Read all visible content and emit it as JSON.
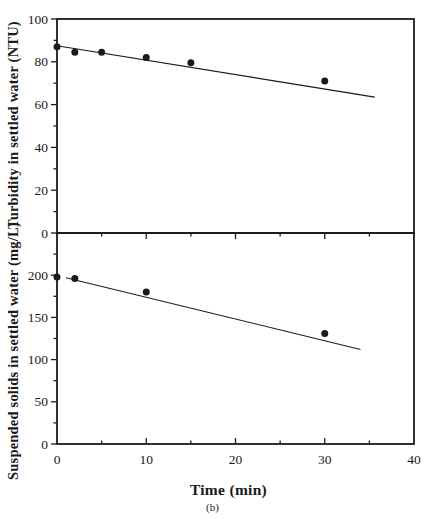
{
  "figure": {
    "xlabel": "Time (min)",
    "caption": "(b)",
    "background": "#ffffff",
    "ink_color": "#1a1a1a"
  },
  "chart_data": [
    {
      "type": "scatter",
      "panel": "top",
      "title": "",
      "ylabel": "Turbidity in settled water (NTU)",
      "xlabel": "Time (min)",
      "xlim": [
        0,
        40
      ],
      "ylim": [
        0,
        100
      ],
      "x_major_ticks": [
        0,
        10,
        20,
        30,
        40
      ],
      "x_minor_ticks": [
        5,
        15,
        25,
        35
      ],
      "y_major_ticks": [
        0,
        20,
        40,
        60,
        80,
        100
      ],
      "y_minor_ticks": [
        10,
        30,
        50,
        70,
        90
      ],
      "grid": false,
      "legend_position": "none",
      "marker": "filled-circle",
      "points": [
        [
          0,
          87
        ],
        [
          2,
          84.5
        ],
        [
          5,
          84.5
        ],
        [
          10,
          82
        ],
        [
          15,
          79.5
        ],
        [
          30,
          71
        ]
      ],
      "trend_line": {
        "x1": 0,
        "y1": 87.5,
        "x2": 35.6,
        "y2": 63.5
      }
    },
    {
      "type": "scatter",
      "panel": "bottom",
      "title": "",
      "ylabel": "Suspended solids in settled water (mg/L)",
      "xlabel": "Time (min)",
      "xlim": [
        0,
        40
      ],
      "ylim": [
        0,
        250
      ],
      "x_major_ticks": [
        0,
        10,
        20,
        30,
        40
      ],
      "x_minor_ticks": [
        5,
        15,
        25,
        35
      ],
      "y_major_ticks": [
        0,
        50,
        100,
        150,
        200
      ],
      "y_minor_ticks": [
        25,
        75,
        125,
        175,
        225
      ],
      "grid": false,
      "legend_position": "none",
      "marker": "filled-circle",
      "points": [
        [
          0,
          198
        ],
        [
          2,
          196
        ],
        [
          10,
          180
        ],
        [
          30,
          131
        ]
      ],
      "trend_line": {
        "x1": 1,
        "y1": 197,
        "x2": 34,
        "y2": 112
      }
    }
  ]
}
